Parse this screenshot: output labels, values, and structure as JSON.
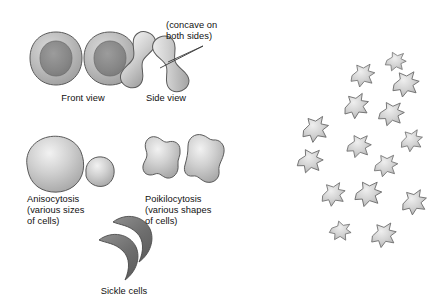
{
  "figure": {
    "background_color": "#ffffff",
    "line_color": "#4a4a4a",
    "text_color": "#111111"
  },
  "labels": {
    "front_view": "Front view",
    "side_view": "Side view",
    "concave_line1": "(concave on",
    "concave_line2": "both sides)",
    "anisocytosis_line1": "Anisocytosis",
    "anisocytosis_line2": "(various sizes",
    "anisocytosis_line3": "of cells)",
    "poikilocytosis_line1": "Poikilocytosis",
    "poikilocytosis_line2": "(various shapes",
    "poikilocytosis_line3": "of cells)",
    "sickle_cells": "Sickle cells"
  },
  "groups": [
    {
      "name": "normal-rbc-front-view",
      "label": "Front view",
      "cell_count": 2,
      "description": "Biconcave discs viewed face-on with lighter rim and darker central pallor"
    },
    {
      "name": "normal-rbc-side-view",
      "label": "Side view",
      "cell_count": 2,
      "description": "Dumbbell shaped cells seen edge-on, concave on both sides"
    },
    {
      "name": "anisocytosis",
      "label": "Anisocytosis (various sizes of cells)",
      "cell_count": 2,
      "description": "One large rounded cell and one small rounded cell"
    },
    {
      "name": "poikilocytosis",
      "label": "Poikilocytosis (various shapes of cells)",
      "cell_count": 2,
      "description": "Two irregular lobed cells of differing outline"
    },
    {
      "name": "sickle-cells",
      "label": "Sickle cells",
      "cell_count": 2,
      "description": "Two dark crescent shaped cells"
    },
    {
      "name": "crenated-cell-cluster",
      "label": "",
      "cell_count": 15,
      "description": "Scattered field of spiculated crenated cells, unlabeled"
    }
  ],
  "annotation": {
    "text": "(concave on both sides)",
    "leader_lines": 2,
    "points_to": "side-view-cells"
  },
  "colors": {
    "cell_light": "#e9e9e9",
    "cell_mid": "#bdbdbd",
    "cell_dark": "#8f8f8f",
    "nucleus_dark": "#7b7b7b",
    "sickle_fill": "#6e6e6e",
    "outline": "#4a4a4a"
  }
}
